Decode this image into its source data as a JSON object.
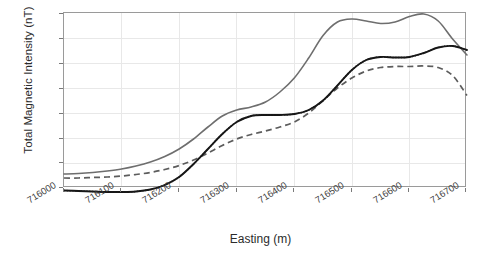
{
  "chart_data": {
    "type": "line",
    "title": "",
    "xlabel": "Easting (m)",
    "ylabel": "Total Magnetic Intensity (nT)",
    "xlim": [
      716000,
      716700
    ],
    "ylim": [
      53550,
      53900
    ],
    "xticks": [
      "716000",
      "716100",
      "716200",
      "716300",
      "716400",
      "716500",
      "716600",
      "716700"
    ],
    "yticks": [
      "53550",
      "53600",
      "53650",
      "53700",
      "53750",
      "53800",
      "53850",
      "53900"
    ],
    "grid": true,
    "legend_position": "none",
    "x": [
      716000,
      716025,
      716050,
      716075,
      716100,
      716125,
      716150,
      716175,
      716200,
      716225,
      716250,
      716275,
      716300,
      716325,
      716350,
      716375,
      716400,
      716425,
      716450,
      716475,
      716500,
      716525,
      716550,
      716575,
      716600,
      716625,
      716650,
      716675,
      716700
    ],
    "series": [
      {
        "name": "upper-gray-solid",
        "style": "solid",
        "color": "#6e6e6e",
        "values": [
          53578,
          53579,
          53581,
          53584,
          53588,
          53594,
          53602,
          53613,
          53628,
          53648,
          53672,
          53694,
          53706,
          53712,
          53722,
          53742,
          53770,
          53810,
          53855,
          53882,
          53888,
          53884,
          53879,
          53882,
          53893,
          53898,
          53884,
          53848,
          53816
        ]
      },
      {
        "name": "middle-gray-dashed",
        "style": "dashed",
        "color": "#5c5c5c",
        "values": [
          53570,
          53570,
          53571,
          53572,
          53574,
          53577,
          53581,
          53587,
          53595,
          53606,
          53620,
          53635,
          53648,
          53657,
          53664,
          53672,
          53682,
          53700,
          53725,
          53750,
          53770,
          53784,
          53791,
          53793,
          53793,
          53794,
          53791,
          53775,
          53735
        ]
      },
      {
        "name": "lower-black-solid",
        "style": "solid",
        "color": "#151515",
        "values": [
          53545,
          53544,
          53543,
          53542,
          53542,
          53543,
          53547,
          53556,
          53572,
          53598,
          53628,
          53658,
          53682,
          53694,
          53696,
          53696,
          53698,
          53706,
          53725,
          53755,
          53786,
          53806,
          53812,
          53811,
          53812,
          53820,
          53831,
          53834,
          53826
        ]
      },
      {
        "name": "lower-black-dotted-overlay",
        "style": "dotted",
        "color": "#1a1a1a",
        "values": [
          53545,
          53544,
          53543,
          53542,
          53542,
          53543,
          53547,
          53556,
          53572,
          53598,
          53628,
          53658,
          53682,
          53694,
          53696,
          53696,
          53698,
          53706,
          53725,
          53755,
          53786,
          53806,
          53812,
          53811,
          53812,
          53820,
          53831,
          53834,
          53826
        ]
      }
    ],
    "tail": {
      "x": [
        716700,
        716725,
        716750,
        716775,
        716800
      ],
      "note": "curves continue to right edge"
    },
    "right_edge_values": {
      "upper_gray_solid": 53793,
      "middle_gray_dashed": 53638,
      "lower_black_solid": 53712
    }
  }
}
